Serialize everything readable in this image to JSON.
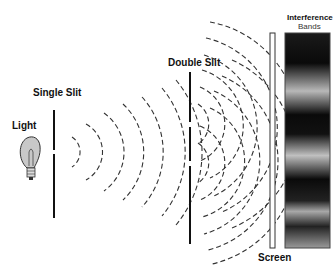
{
  "labels": {
    "light": "Light",
    "single_slit": "Single Slit",
    "double_slit": "Double Slit",
    "screen": "Screen",
    "interference_line1": "Interference",
    "interference_line2": "Bands"
  },
  "colors": {
    "barrier": "#111111",
    "wave": "#333333",
    "band_dark": "#0a0a0a",
    "band_bright": "#b0b0b0",
    "bulb_fill": "#c8c8c8"
  }
}
